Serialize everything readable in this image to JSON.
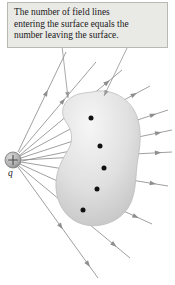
{
  "figure": {
    "background_color": "#ffffff",
    "width": 175,
    "height": 285
  },
  "caption": {
    "box_fill": "#e9e9e6",
    "box_border": "#b9b9b4",
    "text_color": "#1a1a1a",
    "lines": [
      "The number of field lines",
      "entering the surface equals the",
      "number leaving the surface."
    ],
    "full_text": "The number of field lines entering the surface equals the number leaving the surface.",
    "pointers": [
      {
        "name": "caption-pointer-left",
        "from_x": 62,
        "from_y": 46,
        "to_x": 68,
        "to_y": 98
      },
      {
        "name": "caption-pointer-right",
        "from_x": 128,
        "from_y": 46,
        "to_x": 104,
        "to_y": 96
      }
    ]
  },
  "charge": {
    "label": "q",
    "sign": "+",
    "center_x": 13,
    "center_y": 160,
    "radius": 8,
    "fill_color": "#b4b4b4",
    "stroke_color": "#7a7a7a"
  },
  "surface": {
    "name": "closed-gaussian-surface",
    "shape": "kidney-blob",
    "fill_light": "#f4f4f4",
    "fill_dark": "#c6c6c6",
    "stroke_color": "#bdbdbd",
    "path": "M 92,92 C 108,88 125,95 134,110 C 142,124 141,142 138,158 C 135,176 137,194 128,208 C 118,223 98,229 82,224 C 66,219 57,204 56,188 C 55,172 62,160 68,150 C 74,140 72,130 66,122 C 60,113 62,103 72,97 C 78,93 85,93 92,92 Z"
  },
  "intersection_dots": [
    {
      "name": "surface-dot-1",
      "x": 91,
      "y": 118
    },
    {
      "name": "surface-dot-2",
      "x": 100,
      "y": 146
    },
    {
      "name": "surface-dot-3",
      "x": 104,
      "y": 168
    },
    {
      "name": "surface-dot-4",
      "x": 97,
      "y": 189
    },
    {
      "name": "surface-dot-5",
      "x": 83,
      "y": 210
    }
  ],
  "field_lines": {
    "color": "#8e8e8e",
    "arrow_color": "#8e8e8e",
    "count": 11,
    "lines": [
      {
        "name": "field-line-1",
        "x1": 20,
        "y1": 155,
        "x2": 122,
        "y2": 70,
        "arrows": [
          0.55,
          0.88
        ]
      },
      {
        "name": "field-line-2",
        "x1": 20,
        "y1": 156,
        "x2": 150,
        "y2": 86,
        "arrows": [
          0.58,
          0.9
        ]
      },
      {
        "name": "field-line-3",
        "x1": 21,
        "y1": 158,
        "x2": 168,
        "y2": 110,
        "arrows": [
          0.6,
          0.92
        ]
      },
      {
        "name": "field-line-4",
        "x1": 21,
        "y1": 160,
        "x2": 172,
        "y2": 152,
        "arrows": [
          0.62,
          0.93
        ]
      },
      {
        "name": "field-line-5",
        "x1": 21,
        "y1": 162,
        "x2": 168,
        "y2": 186,
        "arrows": [
          0.6,
          0.92
        ]
      },
      {
        "name": "field-line-6",
        "x1": 20,
        "y1": 164,
        "x2": 152,
        "y2": 224,
        "arrows": [
          0.58,
          0.9
        ]
      },
      {
        "name": "field-line-7",
        "x1": 19,
        "y1": 166,
        "x2": 130,
        "y2": 258,
        "arrows": [
          0.56,
          0.88
        ]
      },
      {
        "name": "field-line-8",
        "x1": 18,
        "y1": 167,
        "x2": 98,
        "y2": 278,
        "arrows": [
          0.56,
          0.9
        ]
      },
      {
        "name": "field-line-9",
        "x1": 19,
        "y1": 153,
        "x2": 96,
        "y2": 62,
        "arrows": [
          0.6
        ]
      },
      {
        "name": "field-line-10",
        "x1": 18,
        "y1": 152,
        "x2": 66,
        "y2": 52,
        "arrows": [
          0.62
        ]
      },
      {
        "name": "field-line-11",
        "x1": 22,
        "y1": 161,
        "x2": 172,
        "y2": 130,
        "arrows": [
          0.6,
          0.93
        ]
      }
    ]
  }
}
